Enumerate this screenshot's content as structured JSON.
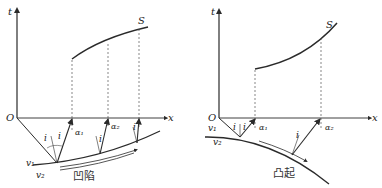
{
  "figures": [
    {
      "id": "concave",
      "caption": "凹陷",
      "axis_t": "t",
      "axis_x": "x",
      "origin": "O",
      "curve": "S",
      "velocity_upper": "v₁",
      "velocity_lower": "v₂",
      "angle_incident": "i",
      "angle_labels": [
        "α₁",
        "α₂"
      ]
    },
    {
      "id": "convex",
      "caption": "凸起",
      "axis_t": "t",
      "axis_x": "x",
      "origin": "O",
      "curve": "S",
      "velocity_upper": "v₁",
      "velocity_lower": "v₂",
      "angle_incident": "i",
      "angle_labels": [
        "α₁",
        "α₂"
      ]
    }
  ],
  "colors": {
    "line": "#2a2a2a",
    "dashed": "#555555",
    "background": "#ffffff"
  }
}
